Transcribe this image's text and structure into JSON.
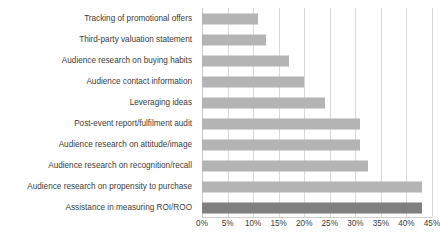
{
  "chart_data": {
    "type": "bar",
    "orientation": "horizontal",
    "title": "",
    "subtitle": "",
    "xlabel": "",
    "ylabel": "",
    "xlim": [
      0,
      45
    ],
    "grid": true,
    "legend": false,
    "tick_suffix": "%",
    "tick_labels": [
      "0%",
      "5%",
      "10%",
      "15%",
      "20%",
      "25%",
      "30%",
      "35%",
      "40%",
      "45%"
    ],
    "ticks": [
      0,
      5,
      10,
      15,
      20,
      25,
      30,
      35,
      40,
      45
    ],
    "categories": [
      "Tracking of promotional offers",
      "Third-party valuation statement",
      "Audience research on buying habits",
      "Audience contact information",
      "Leveraging ideas",
      "Post-event report/fulfilment audit",
      "Audience research on attitude/image",
      "Audience research on recognition/recall",
      "Audience research on propensity to purchase",
      "Assistance in measuring ROI/ROO"
    ],
    "values": [
      11,
      12.5,
      17,
      20,
      24,
      31,
      31,
      32.5,
      43,
      43
    ],
    "colors": {
      "bar": "#b4b4b4",
      "bar_highlight": "#7f7f7f",
      "grid": "#d9d9d9",
      "text": "#3b3b3b",
      "background": "#ffffff"
    },
    "highlight_index": 9
  }
}
